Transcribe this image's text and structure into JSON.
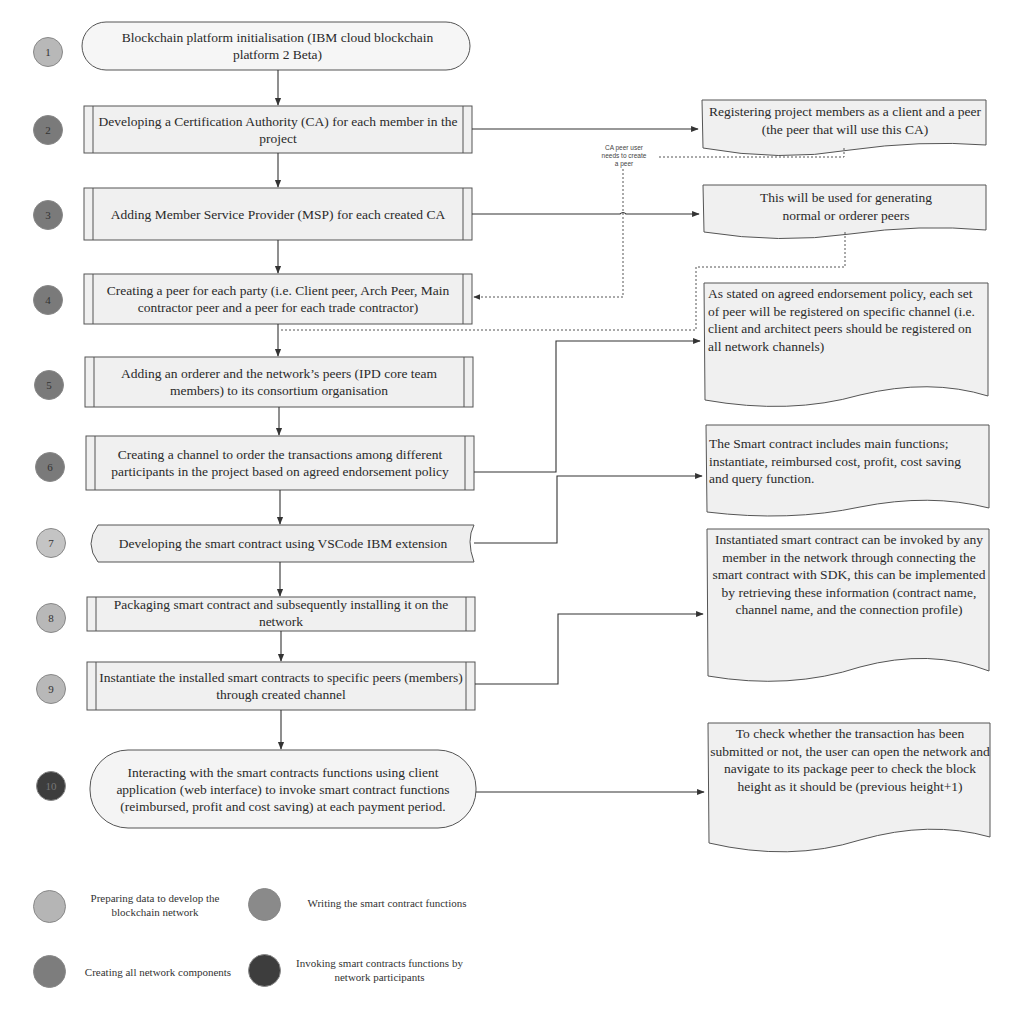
{
  "colors": {
    "phase_prepare": "#b5b5b5",
    "phase_create": "#7d7d7d",
    "phase_write": "#8a8a8a",
    "phase_invoke": "#3d3d3d",
    "box_fill": "#f3f3f3",
    "stroke": "#555555"
  },
  "steps": [
    {
      "number": "1",
      "phase": "prepare",
      "shape": "terminator",
      "text": "Blockchain platform initialisation (IBM cloud blockchain platform 2 Beta)"
    },
    {
      "number": "2",
      "phase": "create",
      "shape": "predefined-process",
      "text": "Developing a Certification Authority (CA) for each  member in the project"
    },
    {
      "number": "3",
      "phase": "create",
      "shape": "predefined-process",
      "text": "Adding Member Service Provider (MSP) for each created CA"
    },
    {
      "number": "4",
      "phase": "create",
      "shape": "predefined-process",
      "text": "Creating a peer for each party (i.e. Client peer, Arch Peer, Main contractor peer and a peer for each trade contractor)"
    },
    {
      "number": "5",
      "phase": "create",
      "shape": "predefined-process",
      "text": "Adding an orderer and the network’s peers (IPD core team members) to its consortium organisation"
    },
    {
      "number": "6",
      "phase": "create",
      "shape": "predefined-process",
      "text": "Creating a channel to order the transactions among different participants in the project based on agreed endorsement policy"
    },
    {
      "number": "7",
      "phase": "prepare",
      "shape": "stored-data",
      "text": "Developing the smart contract using VSCode IBM extension"
    },
    {
      "number": "8",
      "phase": "prepare",
      "shape": "predefined-process",
      "text": "Packaging smart contract and subsequently installing it on the network"
    },
    {
      "number": "9",
      "phase": "prepare",
      "shape": "predefined-process",
      "text": "Instantiate the installed smart contracts to specific peers (members) through created channel"
    },
    {
      "number": "10",
      "phase": "invoke",
      "shape": "terminator",
      "text": "Interacting with the smart contracts functions using client application (web interface) to invoke smart contract functions (reimbursed, profit and cost saving) at each payment period."
    }
  ],
  "notes": [
    {
      "id": "note-ca",
      "text": "Registering project members as a client and a peer (the peer that will use this CA)"
    },
    {
      "id": "note-msp",
      "text": "This will be used for generating normal or orderer peers"
    },
    {
      "id": "note-channel",
      "text": "As stated on agreed endorsement policy, each set of peer will be registered on specific channel (i.e. client and architect peers should be registered on all network channels)"
    },
    {
      "id": "note-smart-contract",
      "text": "The Smart contract includes main functions; instantiate, reimbursed cost, profit, cost saving and query function."
    },
    {
      "id": "note-instantiate",
      "text": "Instantiated smart contract can be invoked by any member in the network through connecting the smart contract with SDK, this can be implemented by retrieving these information (contract name, channel name, and the connection profile)"
    },
    {
      "id": "note-check",
      "text": "To check whether the transaction has been submitted or not, the user can open the network and navigate to its package peer to check the block height as it should be (previous height+1)"
    }
  ],
  "annotation": {
    "text": "CA peer user needs to create a peer"
  },
  "legend": [
    {
      "phase": "prepare",
      "label": "Preparing data to develop the blockchain network"
    },
    {
      "phase": "write",
      "label": "Writing the smart contract functions"
    },
    {
      "phase": "create",
      "label": "Creating all network components"
    },
    {
      "phase": "invoke",
      "label": "Invoking smart contracts functions by network participants"
    }
  ]
}
